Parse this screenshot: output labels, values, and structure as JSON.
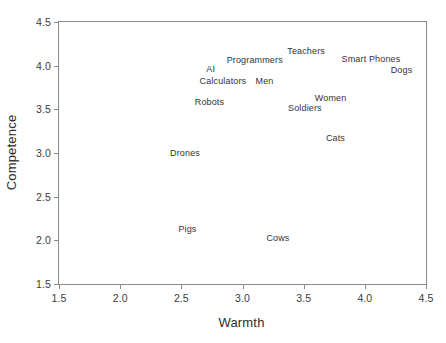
{
  "chart_data": {
    "type": "scatter",
    "title": "",
    "xlabel": "Warmth",
    "ylabel": "Competence",
    "xlim": [
      1.5,
      4.5
    ],
    "ylim": [
      1.5,
      4.5
    ],
    "xticks": [
      "1.5",
      "2.0",
      "2.5",
      "3.0",
      "3.5",
      "4.0",
      "4.5"
    ],
    "yticks": [
      "1.5",
      "2.0",
      "2.5",
      "3.0",
      "3.5",
      "4.0",
      "4.5"
    ],
    "xtick_values": [
      1.5,
      2.0,
      2.5,
      3.0,
      3.5,
      4.0,
      4.5
    ],
    "ytick_values": [
      1.5,
      2.0,
      2.5,
      3.0,
      3.5,
      4.0,
      4.5
    ],
    "grid": false,
    "legend": "none",
    "marker_style": "text-label-only",
    "points": [
      {
        "label": "Teachers",
        "x": 3.52,
        "y": 4.17
      },
      {
        "label": "Smart Phones",
        "x": 4.05,
        "y": 4.08
      },
      {
        "label": "Programmers",
        "x": 3.1,
        "y": 4.06
      },
      {
        "label": "AI",
        "x": 2.74,
        "y": 3.96
      },
      {
        "label": "Dogs",
        "x": 4.3,
        "y": 3.95
      },
      {
        "label": "Calculators",
        "x": 2.84,
        "y": 3.82
      },
      {
        "label": "Men",
        "x": 3.18,
        "y": 3.82
      },
      {
        "label": "Women",
        "x": 3.72,
        "y": 3.63
      },
      {
        "label": "Robots",
        "x": 2.73,
        "y": 3.58
      },
      {
        "label": "Soldiers",
        "x": 3.51,
        "y": 3.52
      },
      {
        "label": "Cats",
        "x": 3.76,
        "y": 3.17
      },
      {
        "label": "Drones",
        "x": 2.53,
        "y": 3.0
      },
      {
        "label": "Pigs",
        "x": 2.55,
        "y": 2.13
      },
      {
        "label": "Cows",
        "x": 3.29,
        "y": 2.03
      }
    ]
  },
  "axes": {
    "x_title": "Warmth",
    "y_title": "Competence"
  },
  "colors": {
    "frame": "#8a8a8a",
    "text": "#343434",
    "background": "#ffffff"
  }
}
